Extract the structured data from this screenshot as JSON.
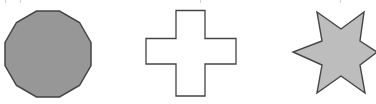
{
  "figure": {
    "background": "#ffffff",
    "outline_color": "#444444",
    "shapes": [
      {
        "id": "dodecagon",
        "label": "Regular dodecagon (12 sides)",
        "sides": 12,
        "fill": "#979797",
        "stroke": "#444444",
        "points": "91,42.5 79.5,22.5 59.5,11 36.5,11 16.5,22.5 5,42.5 5,65.5 16.5,85.5 36.5,97 59.5,97 79.5,85.5 91,65.5"
      },
      {
        "id": "cross",
        "label": "Plus / cross shape",
        "sides": 12,
        "fill": "#ffffff",
        "stroke": "#444444",
        "points": "176,10.5 205,10.5 205,38.5 236,38.5 236,64 205,64 205,96 176,96 176,64 146,64 146,38.5 176,38.5"
      },
      {
        "id": "star",
        "label": "Six-pointed star",
        "points_count": 6,
        "fill": "#bdbdbd",
        "stroke": "#444444",
        "points": "317,12 341,29 364,12 360,41 377,52 360,65 365,93 341,76 317,93 322,65 293,52 322,41"
      }
    ],
    "clipped_text_line": {
      "note_visible": "cropped descenders only; text not legible",
      "marks_x": [
        5,
        20,
        200,
        340
      ]
    }
  }
}
